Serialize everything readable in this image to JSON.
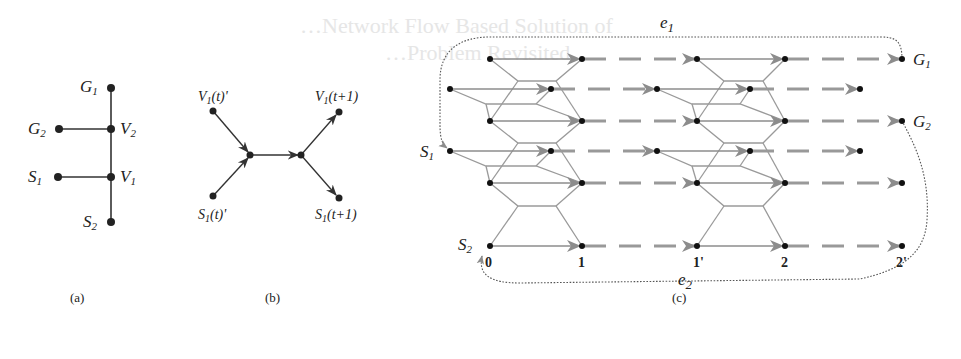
{
  "figure": {
    "background_bleed_text": [
      "…Network Flow Based Solution of",
      "…Problem Revisited"
    ],
    "panels": {
      "a": {
        "caption": "(a)",
        "title": "Graph with two agents",
        "nodes": [
          {
            "id": "G1",
            "label": "G",
            "sub": "1"
          },
          {
            "id": "V2",
            "label": "V",
            "sub": "2"
          },
          {
            "id": "G2",
            "label": "G",
            "sub": "2"
          },
          {
            "id": "V1",
            "label": "V",
            "sub": "1"
          },
          {
            "id": "S1",
            "label": "S",
            "sub": "1"
          },
          {
            "id": "S2",
            "label": "S",
            "sub": "2"
          }
        ],
        "edges": [
          [
            "G1",
            "V2"
          ],
          [
            "G2",
            "V2"
          ],
          [
            "V2",
            "V1"
          ],
          [
            "S1",
            "V1"
          ],
          [
            "V1",
            "S2"
          ]
        ]
      },
      "b": {
        "caption": "(b)",
        "title": "Edge gadget",
        "nodes": [
          {
            "id": "v1t",
            "label": "V",
            "sub": "1",
            "suffix": "(t)'"
          },
          {
            "id": "s1t",
            "label": "S",
            "sub": "1",
            "suffix": "(t)'"
          },
          {
            "id": "v1t1",
            "label": "V",
            "sub": "1",
            "suffix": "(t+1)"
          },
          {
            "id": "s1t1",
            "label": "S",
            "sub": "1",
            "suffix": "(t+1)"
          }
        ]
      },
      "c": {
        "caption": "(c)",
        "title": "Time-expanded network",
        "left_labels": [
          {
            "id": "S1",
            "label": "S",
            "sub": "1"
          },
          {
            "id": "S2",
            "label": "S",
            "sub": "2"
          }
        ],
        "right_labels": [
          {
            "id": "G1",
            "label": "G",
            "sub": "1"
          },
          {
            "id": "G2",
            "label": "G",
            "sub": "2"
          }
        ],
        "loop_labels": [
          {
            "id": "e1",
            "label": "e",
            "sub": "1"
          },
          {
            "id": "e2",
            "label": "e",
            "sub": "2"
          }
        ],
        "time_ticks": [
          "0",
          "1",
          "1'",
          "2",
          "2'"
        ]
      }
    }
  },
  "colors": {
    "ink": "#222222",
    "gadget_line": "#9a9a9a",
    "arrow_gray": "#8c8c8c",
    "dotted_loop": "#555555",
    "bleed": "#e6e6e6"
  }
}
